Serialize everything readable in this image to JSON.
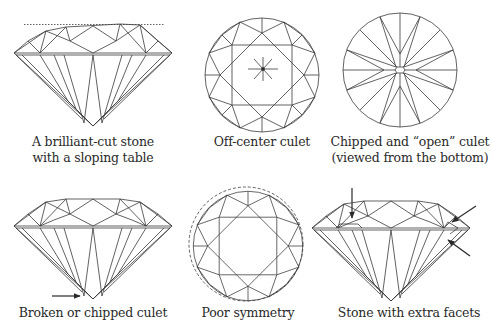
{
  "figures": [
    {
      "id": "sloping-table",
      "caption_line1": "A brilliant-cut stone",
      "caption_line2": "with a sloping table"
    },
    {
      "id": "off-center-culet",
      "caption_line1": "Off-center culet"
    },
    {
      "id": "open-culet",
      "caption_line1": "Chipped and “open” culet",
      "caption_line2": "(viewed from the bottom)"
    },
    {
      "id": "chipped-culet",
      "caption_line1": "Broken or chipped culet"
    },
    {
      "id": "poor-symmetry",
      "caption_line1": "Poor symmetry"
    },
    {
      "id": "extra-facets",
      "caption_line1": "Stone with extra facets"
    }
  ],
  "colors": {
    "line": "#3a3a3a",
    "text": "#2a2a2a",
    "background": "#ffffff"
  }
}
